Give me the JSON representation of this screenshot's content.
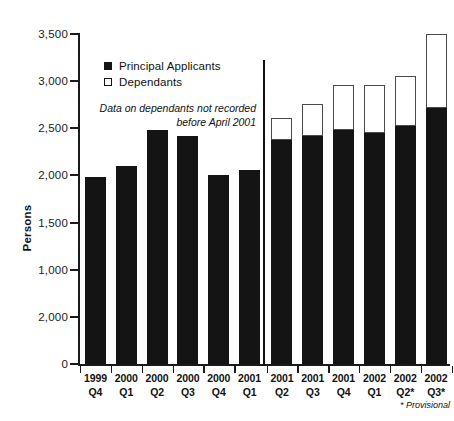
{
  "chart_data": {
    "type": "bar",
    "subtype": "stacked-bar",
    "title": "",
    "xlabel": "",
    "ylabel": "Persons",
    "ylim": [
      0,
      3500
    ],
    "grid": false,
    "legend_position": "top-left",
    "y_ticks": [
      {
        "value": 3500,
        "label": "3,500"
      },
      {
        "value": 3000,
        "label": "3,000"
      },
      {
        "value": 2500,
        "label": "2,500"
      },
      {
        "value": 2000,
        "label": "2,000"
      },
      {
        "value": 1500,
        "label": "1,500"
      },
      {
        "value": 1000,
        "label": "1,000"
      },
      {
        "value": 500,
        "label": "2,000"
      },
      {
        "value": 0,
        "label": "0"
      }
    ],
    "categories": [
      {
        "year": "1999",
        "quarter": "Q4"
      },
      {
        "year": "2000",
        "quarter": "Q1"
      },
      {
        "year": "2000",
        "quarter": "Q2"
      },
      {
        "year": "2000",
        "quarter": "Q3"
      },
      {
        "year": "2000",
        "quarter": "Q4"
      },
      {
        "year": "2001",
        "quarter": "Q1"
      },
      {
        "year": "2001",
        "quarter": "Q2"
      },
      {
        "year": "2001",
        "quarter": "Q3"
      },
      {
        "year": "2001",
        "quarter": "Q4"
      },
      {
        "year": "2002",
        "quarter": "Q1"
      },
      {
        "year": "2002",
        "quarter": "Q2*"
      },
      {
        "year": "2002",
        "quarter": "Q3*"
      }
    ],
    "series": [
      {
        "name": "Principal Applicants",
        "style": "filled",
        "color": "#141414",
        "values": [
          1980,
          2100,
          2480,
          2420,
          2000,
          2060,
          2380,
          2420,
          2480,
          2450,
          2520,
          2720
        ]
      },
      {
        "name": "Dependants",
        "style": "hollow",
        "color": "#ffffff",
        "values": [
          null,
          null,
          null,
          null,
          null,
          null,
          230,
          340,
          480,
          510,
          530,
          780
        ]
      }
    ],
    "totals": [
      1980,
      2100,
      2480,
      2420,
      2000,
      2060,
      2610,
      2760,
      2960,
      2960,
      3050,
      3500
    ],
    "annotations": [
      {
        "name": "dependants-note",
        "text": "Data on dependants not recorded before April 2001"
      },
      {
        "name": "provisional-note",
        "text": "* Provisional"
      }
    ],
    "divider": {
      "after_category_index": 5,
      "label": "April 2001 data split"
    }
  },
  "legend": {
    "items": [
      {
        "label": "Principal Applicants",
        "style": "filled"
      },
      {
        "label": "Dependants",
        "style": "hollow"
      }
    ]
  },
  "notes": {
    "dependants": "Data on dependants not recorded",
    "dependants_line2": "before April 2001",
    "provisional": "* Provisional"
  }
}
